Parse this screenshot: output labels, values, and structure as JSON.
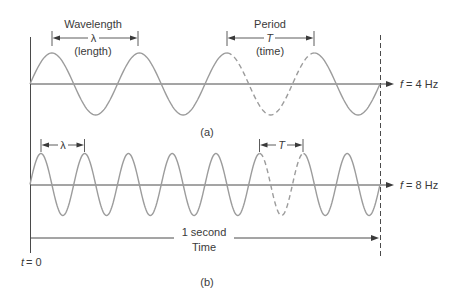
{
  "figure": {
    "panel_a": {
      "label": "(a)",
      "wavelength_title": "Wavelength",
      "wavelength_symbol": "λ",
      "wavelength_note": "(length)",
      "period_title": "Period",
      "period_symbol": "T",
      "period_note": "(time)",
      "freq_var": "f",
      "freq_value": "= 4 Hz"
    },
    "panel_b": {
      "label": "(b)",
      "wavelength_symbol": "λ",
      "period_symbol": "T",
      "freq_var": "f",
      "freq_value": "= 8 Hz"
    },
    "time_axis": {
      "duration_label": "1 second",
      "axis_label": "Time",
      "origin_var": "t",
      "origin_value": "= 0"
    }
  },
  "waves": [
    {
      "id": "a",
      "frequency_hz": 4,
      "cycles": 4,
      "x0": 30,
      "x1": 380,
      "center_y": 84,
      "amplitude": 31,
      "dashed_cycle_start": 2.25,
      "dashed_cycle_end": 3.25,
      "color": "#9c9c9c"
    },
    {
      "id": "b",
      "frequency_hz": 8,
      "cycles": 8,
      "x0": 30,
      "x1": 380,
      "center_y": 184.5,
      "amplitude": 31,
      "dashed_cycle_start": 5.25,
      "dashed_cycle_end": 6.25,
      "color": "#9c9c9c"
    }
  ]
}
